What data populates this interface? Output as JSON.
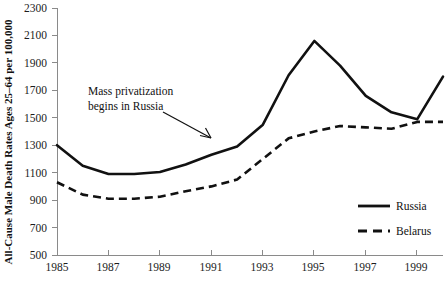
{
  "chart_data": {
    "type": "line",
    "title": "",
    "xlabel": "",
    "ylabel": "All-Cause Male Death Rates Ages 25–64 per 100,000",
    "xlim": [
      1985,
      2000
    ],
    "ylim": [
      500,
      2300
    ],
    "ytick_step": 200,
    "xtick_step": 2,
    "grid": false,
    "legend_position": "bottom-right",
    "x": [
      1985,
      1986,
      1987,
      1988,
      1989,
      1990,
      1991,
      1992,
      1993,
      1994,
      1995,
      1996,
      1997,
      1998,
      1999,
      2000
    ],
    "yticks": [
      500,
      700,
      900,
      1100,
      1300,
      1500,
      1700,
      1900,
      2100,
      2300
    ],
    "xticks": [
      1985,
      1987,
      1989,
      1991,
      1993,
      1995,
      1997,
      1999
    ],
    "series": [
      {
        "name": "Russia",
        "style": "solid",
        "color": "#111111",
        "values": [
          1300,
          1150,
          1090,
          1090,
          1105,
          1160,
          1230,
          1290,
          1450,
          1810,
          2060,
          1880,
          1660,
          1540,
          1490,
          1800
        ]
      },
      {
        "name": "Belarus",
        "style": "dashed",
        "color": "#111111",
        "values": [
          1030,
          940,
          910,
          910,
          925,
          965,
          1000,
          1050,
          1200,
          1350,
          1400,
          1440,
          1430,
          1420,
          1470,
          1470
        ]
      }
    ],
    "annotations": [
      {
        "name": "mass-privatization-note",
        "line1": "Mass privatization",
        "line2": "begins in Russia",
        "arrow_from": [
          160,
          110
        ],
        "arrow_to": [
          212,
          137
        ]
      }
    ]
  },
  "legend": {
    "items": [
      {
        "label": "Russia",
        "style": "solid"
      },
      {
        "label": "Belarus",
        "style": "dashed"
      }
    ]
  },
  "ytick_labels": [
    "500",
    "700",
    "900",
    "1100",
    "1300",
    "1500",
    "1700",
    "1900",
    "2100",
    "2300"
  ],
  "xtick_labels": [
    "1985",
    "1987",
    "1989",
    "1991",
    "1993",
    "1995",
    "1997",
    "1999"
  ]
}
